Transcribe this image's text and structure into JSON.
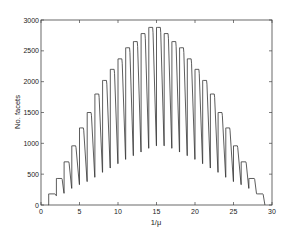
{
  "chart_data": {
    "type": "line",
    "title": "",
    "xlabel": "1/μ",
    "ylabel": "No. facets",
    "xlim": [
      0,
      30
    ],
    "ylim": [
      0,
      3000
    ],
    "xticks": [
      0,
      5,
      10,
      15,
      20,
      25,
      30
    ],
    "yticks": [
      0,
      500,
      1000,
      1500,
      2000,
      2500,
      3000
    ],
    "grid": false,
    "legend": null,
    "series": [
      {
        "name": "facets",
        "segments": [
          {
            "x_start": 1.0,
            "x_end": 1.8,
            "peak": 180,
            "trough": 150
          },
          {
            "x_start": 2.0,
            "x_end": 2.7,
            "peak": 430,
            "trough": 190
          },
          {
            "x_start": 3.0,
            "x_end": 3.6,
            "peak": 700,
            "trough": 270
          },
          {
            "x_start": 4.0,
            "x_end": 4.5,
            "peak": 960,
            "trough": 330
          },
          {
            "x_start": 5.0,
            "x_end": 5.5,
            "peak": 1250,
            "trough": 380
          },
          {
            "x_start": 6.0,
            "x_end": 6.5,
            "peak": 1500,
            "trough": 450
          },
          {
            "x_start": 7.0,
            "x_end": 7.5,
            "peak": 1800,
            "trough": 530
          },
          {
            "x_start": 8.0,
            "x_end": 8.5,
            "peak": 2020,
            "trough": 600
          },
          {
            "x_start": 9.0,
            "x_end": 9.5,
            "peak": 2200,
            "trough": 670
          },
          {
            "x_start": 10.0,
            "x_end": 10.5,
            "peak": 2370,
            "trough": 740
          },
          {
            "x_start": 11.0,
            "x_end": 11.5,
            "peak": 2550,
            "trough": 800
          },
          {
            "x_start": 12.0,
            "x_end": 12.5,
            "peak": 2650,
            "trough": 860
          },
          {
            "x_start": 13.0,
            "x_end": 13.5,
            "peak": 2780,
            "trough": 920
          },
          {
            "x_start": 14.0,
            "x_end": 14.5,
            "peak": 2880,
            "trough": 960
          },
          {
            "x_start": 15.0,
            "x_end": 15.5,
            "peak": 2880,
            "trough": 960
          },
          {
            "x_start": 16.0,
            "x_end": 16.5,
            "peak": 2780,
            "trough": 920
          },
          {
            "x_start": 17.0,
            "x_end": 17.5,
            "peak": 2650,
            "trough": 860
          },
          {
            "x_start": 18.0,
            "x_end": 18.5,
            "peak": 2550,
            "trough": 800
          },
          {
            "x_start": 19.0,
            "x_end": 19.5,
            "peak": 2370,
            "trough": 740
          },
          {
            "x_start": 20.0,
            "x_end": 20.5,
            "peak": 2200,
            "trough": 670
          },
          {
            "x_start": 21.0,
            "x_end": 21.5,
            "peak": 2020,
            "trough": 600
          },
          {
            "x_start": 22.0,
            "x_end": 22.5,
            "peak": 1800,
            "trough": 530
          },
          {
            "x_start": 23.0,
            "x_end": 23.5,
            "peak": 1500,
            "trough": 450
          },
          {
            "x_start": 24.0,
            "x_end": 24.5,
            "peak": 1250,
            "trough": 380
          },
          {
            "x_start": 25.0,
            "x_end": 25.5,
            "peak": 960,
            "trough": 330
          },
          {
            "x_start": 26.0,
            "x_end": 26.6,
            "peak": 700,
            "trough": 270
          },
          {
            "x_start": 27.0,
            "x_end": 27.7,
            "peak": 430,
            "trough": 190
          },
          {
            "x_start": 28.0,
            "x_end": 28.8,
            "peak": 180,
            "trough": 0
          }
        ]
      }
    ]
  },
  "style": {
    "line_color": "#333333",
    "axis_color": "#444444"
  }
}
